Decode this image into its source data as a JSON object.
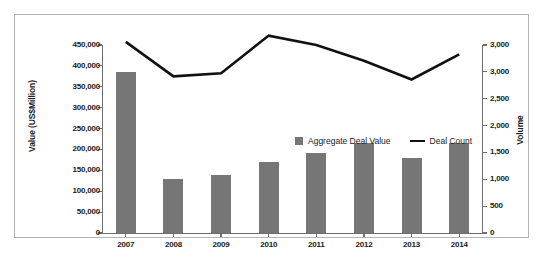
{
  "chart_data": {
    "type": "bar",
    "title": "",
    "subtitle": "",
    "xlabel": "",
    "ylabel": "Value (US$Million)",
    "y2label": "Volume",
    "categories": [
      "2007",
      "2008",
      "2009",
      "2010",
      "2011",
      "2012",
      "2013",
      "2014"
    ],
    "grid": false,
    "legend_position": "inside-upper-center",
    "ylim": [
      0,
      450000
    ],
    "y2lim": [
      0,
      3000
    ],
    "yticks": [
      0,
      50000,
      100000,
      150000,
      200000,
      250000,
      300000,
      350000,
      400000,
      450000
    ],
    "ytick_labels": [
      "0",
      "50,000",
      "100,000",
      "150,000",
      "200,000",
      "250,000",
      "300,000",
      "350,000",
      "400,000",
      "450,000"
    ],
    "y2ticks": [
      0,
      500,
      1000,
      1500,
      2000,
      2500,
      3000,
      3000
    ],
    "y2tick_labels": [
      "0",
      "500",
      "1,000",
      "1,500",
      "2,000",
      "2,500",
      "3,000",
      "3,000"
    ],
    "series": [
      {
        "name": "Aggregate Deal Value",
        "type": "bar",
        "axis": "left",
        "color": "#767676",
        "values": [
          385000,
          129000,
          139000,
          170000,
          191000,
          215000,
          180000,
          215000
        ]
      },
      {
        "name": "Deal Count",
        "type": "line",
        "axis": "right",
        "color": "#111111",
        "values": [
          3050,
          2500,
          2550,
          3150,
          3000,
          2750,
          2450,
          2850
        ]
      }
    ]
  },
  "legend": {
    "items": [
      {
        "label": "Aggregate Deal Value",
        "marker": "square-swatch-icon"
      },
      {
        "label": "Deal Count",
        "marker": "line-swatch-icon"
      }
    ]
  },
  "axes": {
    "left_title": "Value (US$Million)",
    "right_title": "Volume"
  },
  "colors": {
    "bar": "#767676",
    "line": "#111111",
    "axis": "#6e6e6e",
    "frame": "#b4b4b4",
    "text": "#1a1a1a",
    "background": "#ffffff"
  }
}
